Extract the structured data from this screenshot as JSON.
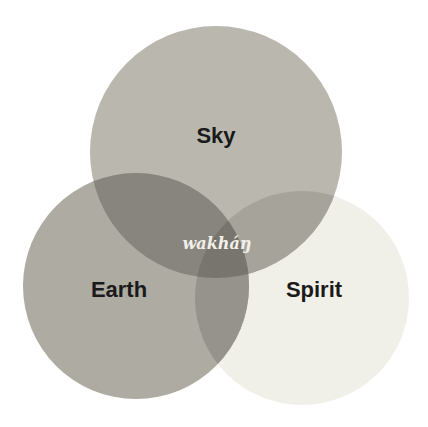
{
  "diagram": {
    "type": "venn",
    "circles": [
      {
        "id": "sky",
        "label": "Sky",
        "cx": 216,
        "cy": 152,
        "r": 126,
        "color": "#b9b6ad"
      },
      {
        "id": "earth",
        "label": "Earth",
        "cx": 136,
        "cy": 286,
        "r": 113,
        "color": "#aeaba3"
      },
      {
        "id": "spirit",
        "label": "Spirit",
        "cx": 302,
        "cy": 298,
        "r": 107,
        "color": "#f1f0e8"
      }
    ],
    "intersection_label": "wakháŋ",
    "colors": {
      "sky_earth": "#86837c",
      "sky_spirit": "#a5a29a",
      "earth_spirit": "#95928b",
      "all_three": "#77746e"
    }
  }
}
